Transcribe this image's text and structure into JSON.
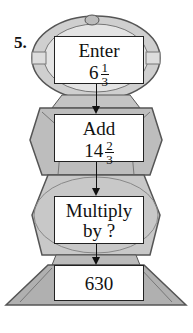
{
  "problem_number": "5.",
  "boxes": [
    {
      "line1": "Enter",
      "whole": "6",
      "numerator": "1",
      "denominator": "3"
    },
    {
      "line1": "Add",
      "whole": "14",
      "numerator": "2",
      "denominator": "3"
    },
    {
      "line1": "Multiply",
      "line2": "by ?"
    },
    {
      "line1": "630"
    }
  ],
  "colors": {
    "robot_gray": "#9a9a9a",
    "robot_light": "#d8d8d8",
    "outline": "#222222"
  }
}
